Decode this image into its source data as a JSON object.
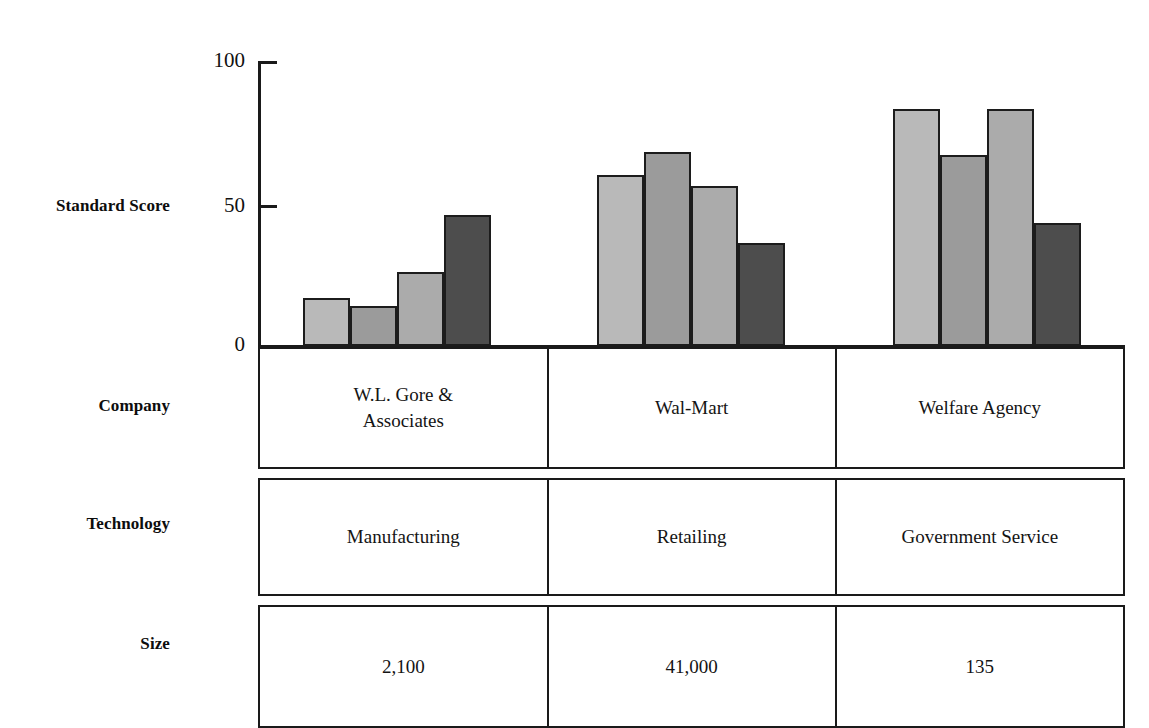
{
  "chart_data": {
    "type": "bar",
    "title": "",
    "xlabel": "",
    "ylabel": "Standard Score",
    "ylim": [
      0,
      100
    ],
    "yticks": [
      0,
      50,
      100
    ],
    "ytick_labels": [
      "0",
      "50",
      "100"
    ],
    "grid": false,
    "legend": "none",
    "categories": [
      "W.L. Gore & Associates",
      "Wal-Mart",
      "Welfare Agency"
    ],
    "bars_per_group": 4,
    "series": [
      {
        "name": "Series 1",
        "color": "#b9b9b9",
        "values": [
          17,
          60,
          83
        ]
      },
      {
        "name": "Series 2",
        "color": "#9b9b9b",
        "values": [
          14,
          68,
          67
        ]
      },
      {
        "name": "Series 3",
        "color": "#ababab",
        "values": [
          26,
          56,
          83
        ]
      },
      {
        "name": "Series 4",
        "color": "#4d4d4d",
        "values": [
          46,
          36,
          43
        ]
      }
    ]
  },
  "axis": {
    "y_label": "Standard Score",
    "ticks": {
      "top": "100",
      "mid": "50",
      "zero": "0"
    }
  },
  "row_labels": {
    "company": "Company",
    "technology": "Technology",
    "size": "Size"
  },
  "table": {
    "company": {
      "col1_line1": "W.L. Gore &",
      "col1_line2": "Associates",
      "col2": "Wal-Mart",
      "col3": "Welfare Agency"
    },
    "technology": {
      "col1": "Manufacturing",
      "col2": "Retailing",
      "col3": "Government Service"
    },
    "size": {
      "col1": "2,100",
      "col2": "41,000",
      "col3": "135"
    }
  },
  "colors": {
    "bar_1": "#b9b9b9",
    "bar_2": "#9b9b9b",
    "bar_3": "#ababab",
    "bar_4": "#4d4d4d",
    "stroke": "#1a1a1a",
    "text": "#111111"
  }
}
